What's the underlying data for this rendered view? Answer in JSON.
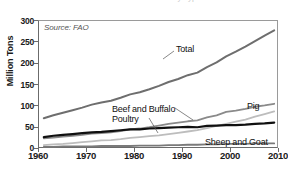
{
  "figure": {
    "title_clipped": "Global Meat Production by Type",
    "source_note": "Source: FAO"
  },
  "chart_data": {
    "type": "line",
    "title": "Global Meat Production by Type",
    "xlabel": "",
    "ylabel": "Million Tons",
    "xlim": [
      1960,
      2010
    ],
    "ylim": [
      0,
      300
    ],
    "xticks": [
      1960,
      1970,
      1980,
      1990,
      2000,
      2010
    ],
    "yticks": [
      0,
      50,
      100,
      150,
      200,
      250,
      300
    ],
    "grid": false,
    "legend": "inline-annotations",
    "annotations": [
      {
        "text": "Source: FAO",
        "x": 1961.5,
        "y": 292
      }
    ],
    "x": [
      1961,
      1963,
      1965,
      1967,
      1969,
      1971,
      1973,
      1975,
      1977,
      1979,
      1981,
      1983,
      1985,
      1987,
      1989,
      1991,
      1993,
      1995,
      1997,
      1999,
      2001,
      2003,
      2005,
      2007,
      2009
    ],
    "series": [
      {
        "name": "Total",
        "color": "#6e6e6e",
        "width": 2.0,
        "values": [
          72,
          79,
          85,
          91,
          97,
          104,
          109,
          113,
          120,
          128,
          133,
          140,
          148,
          157,
          164,
          173,
          179,
          192,
          203,
          217,
          228,
          240,
          253,
          266,
          278
        ]
      },
      {
        "name": "Pig",
        "color": "#8a8a8a",
        "width": 1.8,
        "values": [
          25,
          27,
          29,
          31,
          33,
          36,
          37,
          39,
          42,
          46,
          48,
          51,
          55,
          59,
          62,
          65,
          67,
          74,
          79,
          87,
          90,
          94,
          99,
          102,
          106
        ]
      },
      {
        "name": "Poultry",
        "color": "#bdbdbd",
        "width": 1.8,
        "values": [
          9,
          11,
          12,
          14,
          16,
          18,
          20,
          21,
          23,
          26,
          28,
          30,
          32,
          35,
          38,
          41,
          44,
          49,
          54,
          59,
          64,
          69,
          76,
          82,
          88
        ]
      },
      {
        "name": "Beef and Buffalo",
        "color": "#101010",
        "width": 2.2,
        "values": [
          28,
          31,
          33,
          35,
          37,
          39,
          40,
          42,
          44,
          46,
          46,
          48,
          49,
          50,
          51,
          52,
          51,
          54,
          55,
          56,
          56,
          57,
          59,
          60,
          62
        ]
      },
      {
        "name": "Sheep and Goat",
        "color": "#7a7a7a",
        "width": 1.8,
        "values": [
          5,
          5,
          6,
          6,
          6,
          6,
          7,
          7,
          7,
          7,
          8,
          8,
          8,
          9,
          9,
          10,
          10,
          11,
          11,
          12,
          12,
          12,
          13,
          13,
          13
        ]
      }
    ],
    "series_labels": [
      {
        "name": "Total",
        "label": "Total"
      },
      {
        "name": "Pig",
        "label": "Pig"
      },
      {
        "name": "Beef and Buffalo",
        "label": "Beef and Buffalo"
      },
      {
        "name": "Poultry",
        "label": "Poultry"
      },
      {
        "name": "Sheep and Goat",
        "label": "Sheep and Goat"
      }
    ]
  },
  "axes": {
    "y": {
      "title": "Million Tons",
      "ticks": [
        "300",
        "250",
        "200",
        "150",
        "100",
        "50",
        "0"
      ]
    },
    "x": {
      "ticks": [
        "1960",
        "1970",
        "1980",
        "1990",
        "2000",
        "2010"
      ]
    }
  }
}
